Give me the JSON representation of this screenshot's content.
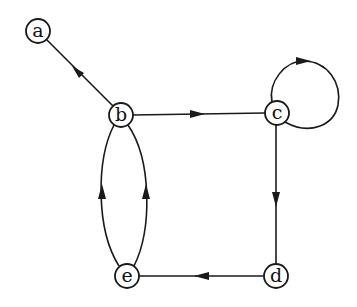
{
  "diagram": {
    "type": "directed-graph",
    "nodes": [
      {
        "id": "a",
        "label": "a",
        "x": 38,
        "y": 31
      },
      {
        "id": "b",
        "label": "b",
        "x": 121,
        "y": 115
      },
      {
        "id": "c",
        "label": "c",
        "x": 277,
        "y": 113
      },
      {
        "id": "d",
        "label": "d",
        "x": 276,
        "y": 276
      },
      {
        "id": "e",
        "label": "e",
        "x": 127,
        "y": 276
      }
    ],
    "edges": [
      {
        "from": "b",
        "to": "a"
      },
      {
        "from": "b",
        "to": "c"
      },
      {
        "from": "c",
        "to": "c",
        "type": "self-loop"
      },
      {
        "from": "c",
        "to": "d"
      },
      {
        "from": "d",
        "to": "e"
      },
      {
        "from": "e",
        "to": "b",
        "curve": "left"
      },
      {
        "from": "e",
        "to": "b",
        "curve": "right"
      }
    ],
    "colors": {
      "stroke": "#1a1a1a",
      "background": "#ffffff"
    }
  }
}
